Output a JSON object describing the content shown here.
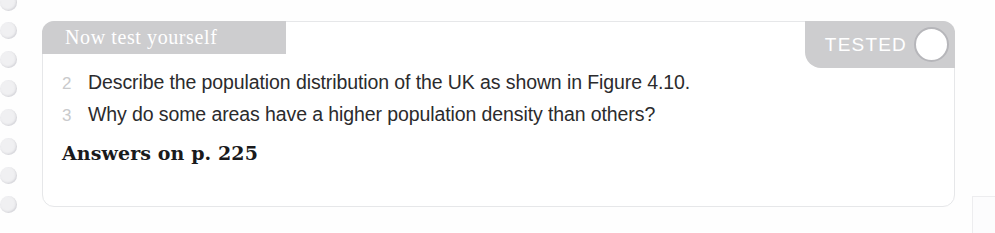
{
  "card": {
    "title": "Now test yourself",
    "tested_badge": {
      "label": "TESTED",
      "checkbox_icon": "circle-checkbox-icon",
      "checked": false,
      "background_color": "#cdcdcf",
      "label_color": "#ffffff"
    },
    "header_background_color": "#cdcdcf",
    "border_color": "#e6e7e9",
    "background_color": "#ffffff"
  },
  "questions": [
    {
      "number": "2",
      "text": "Describe the population distribution of the UK as shown in Figure 4.10."
    },
    {
      "number": "3",
      "text": "Why do some areas have a higher population density than others?"
    }
  ],
  "answers_reference": "Answers on p. 225",
  "binding": {
    "hole_icon": "spiral-binding-hole-icon",
    "hole_count": 8,
    "hole_color": "#f0f0f2"
  },
  "colors": {
    "page_background": "#fefefe",
    "question_number": "#c9cacc",
    "question_text": "#2b2b2d",
    "answers_text": "#1a1a1c"
  }
}
